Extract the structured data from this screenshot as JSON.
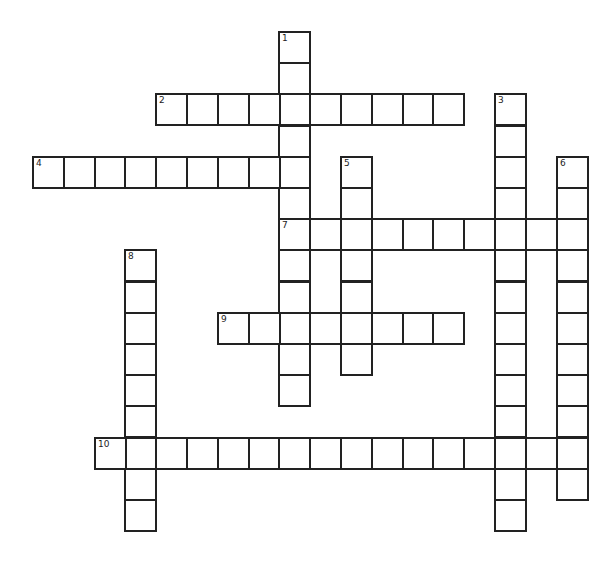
{
  "puzzle": {
    "grid": {
      "x0": 32,
      "y0": 31,
      "cell": 30.8,
      "cellH": 31.2
    },
    "entries": [
      {
        "number": "1",
        "direction": "down",
        "row": 0,
        "col": 8,
        "length": 12
      },
      {
        "number": "2",
        "direction": "across",
        "row": 2,
        "col": 4,
        "length": 10
      },
      {
        "number": "3",
        "direction": "down",
        "row": 2,
        "col": 15,
        "length": 14
      },
      {
        "number": "4",
        "direction": "across",
        "row": 4,
        "col": 0,
        "length": 9
      },
      {
        "number": "5",
        "direction": "down",
        "row": 4,
        "col": 10,
        "length": 7
      },
      {
        "number": "6",
        "direction": "down",
        "row": 4,
        "col": 17,
        "length": 11
      },
      {
        "number": "7",
        "direction": "across",
        "row": 6,
        "col": 8,
        "length": 10
      },
      {
        "number": "8",
        "direction": "down",
        "row": 7,
        "col": 3,
        "length": 9
      },
      {
        "number": "9",
        "direction": "across",
        "row": 9,
        "col": 6,
        "length": 8
      },
      {
        "number": "10",
        "direction": "across",
        "row": 13,
        "col": 2,
        "length": 16
      }
    ]
  }
}
